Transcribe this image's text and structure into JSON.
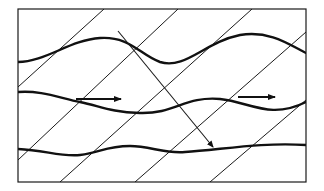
{
  "diagram": {
    "title": "",
    "frame": {
      "x": 18,
      "y": 9,
      "width": 288,
      "height": 173
    },
    "colors": {
      "stroke": "#111111",
      "background": "#ffffff"
    },
    "wavefronts": [
      {
        "x1": 18,
        "y1": 87,
        "x2": 104,
        "y2": 9
      },
      {
        "x1": 18,
        "y1": 160,
        "x2": 178,
        "y2": 9
      },
      {
        "x1": 60,
        "y1": 182,
        "x2": 252,
        "y2": 9
      },
      {
        "x1": 135,
        "y1": 182,
        "x2": 306,
        "y2": 32
      },
      {
        "x1": 210,
        "y1": 182,
        "x2": 306,
        "y2": 100
      }
    ],
    "waves": [
      {
        "name": "wave-top",
        "d": "M18,62 C45,62 70,40 100,38 C130,36 140,55 160,62 C185,70 205,42 240,35 C270,30 290,45 306,53"
      },
      {
        "name": "wave-middle",
        "d": "M18,92 C40,90 60,98 80,102 C100,106 110,112 140,113 C175,114 185,96 220,99 C250,102 270,120 306,102"
      },
      {
        "name": "wave-bottom",
        "d": "M18,149 C45,150 60,157 80,155 C100,153 105,146 130,146 C150,146 165,154 185,152 C220,150 260,142 306,145"
      }
    ],
    "arrows": [
      {
        "name": "horizontal-arrow-left",
        "x1": 76,
        "y1": 99,
        "x2": 121,
        "y2": 99
      },
      {
        "name": "horizontal-arrow-right",
        "x1": 238,
        "y1": 97,
        "x2": 275,
        "y2": 97
      },
      {
        "name": "diagonal-arrow",
        "x1": 118,
        "y1": 31,
        "x2": 213,
        "y2": 147
      }
    ]
  }
}
